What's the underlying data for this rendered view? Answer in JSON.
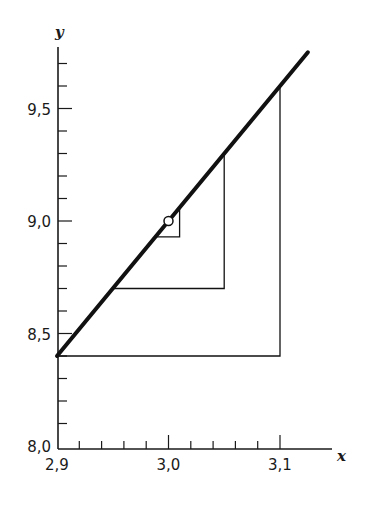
{
  "chart_data": {
    "type": "line",
    "title": "",
    "xlabel": "x",
    "ylabel": "y",
    "xlim": [
      2.9,
      3.13
    ],
    "ylim": [
      8.0,
      9.75
    ],
    "grid": false,
    "legend": null,
    "x_ticks": {
      "major": [
        2.9,
        3.0,
        3.1
      ],
      "major_labels": [
        "2,9",
        "3,0",
        "3,1"
      ],
      "minor_step": 0.02
    },
    "y_ticks": {
      "major": [
        8.0,
        8.5,
        9.0,
        9.5
      ],
      "major_labels": [
        "8,0",
        "8,5",
        "9,0",
        "9,5"
      ],
      "minor_step": 0.1
    },
    "series": [
      {
        "name": "line",
        "style": "thick",
        "equation": "y = 9 + 6(x - 3)",
        "x": [
          2.9,
          3.125
        ],
        "y": [
          8.4,
          9.75
        ]
      },
      {
        "name": "iteration-1",
        "style": "thin",
        "x": [
          3.1,
          3.1,
          2.9
        ],
        "y": [
          9.6,
          8.4,
          8.4
        ]
      },
      {
        "name": "iteration-2",
        "style": "thin",
        "x": [
          3.05,
          3.05,
          2.95
        ],
        "y": [
          9.3,
          8.7,
          8.7
        ]
      },
      {
        "name": "iteration-3",
        "style": "thin",
        "x": [
          3.01,
          3.01,
          2.99
        ],
        "y": [
          9.06,
          8.93,
          8.93
        ]
      }
    ],
    "annotations": [
      {
        "type": "open-circle",
        "x": 3.0,
        "y": 9.0,
        "label": "fixed point"
      }
    ]
  }
}
